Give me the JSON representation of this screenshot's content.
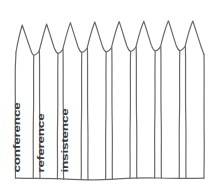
{
  "figure": {
    "name": "picket-fence-sketch",
    "style": "hand-drawn",
    "background_color": "#ffffff",
    "stroke_color": "#6a6a6a",
    "text_color": "#3a3a3a",
    "picket_count": 8
  },
  "labels": [
    {
      "id": "conference",
      "text": "conference",
      "orientation": "vertical-bottom-up",
      "picket_index": 1
    },
    {
      "id": "reference",
      "text": "reference",
      "orientation": "vertical-bottom-up",
      "picket_index": 2
    },
    {
      "id": "insistence",
      "text": "insistence",
      "orientation": "vertical-bottom-up",
      "picket_index": 3
    }
  ],
  "geometry": {
    "baseline_y": 178,
    "left_edge_x": 15,
    "right_edge_x": 204,
    "peak_y_range": [
      22,
      30
    ],
    "shoulder_y_range": [
      46,
      56
    ]
  }
}
